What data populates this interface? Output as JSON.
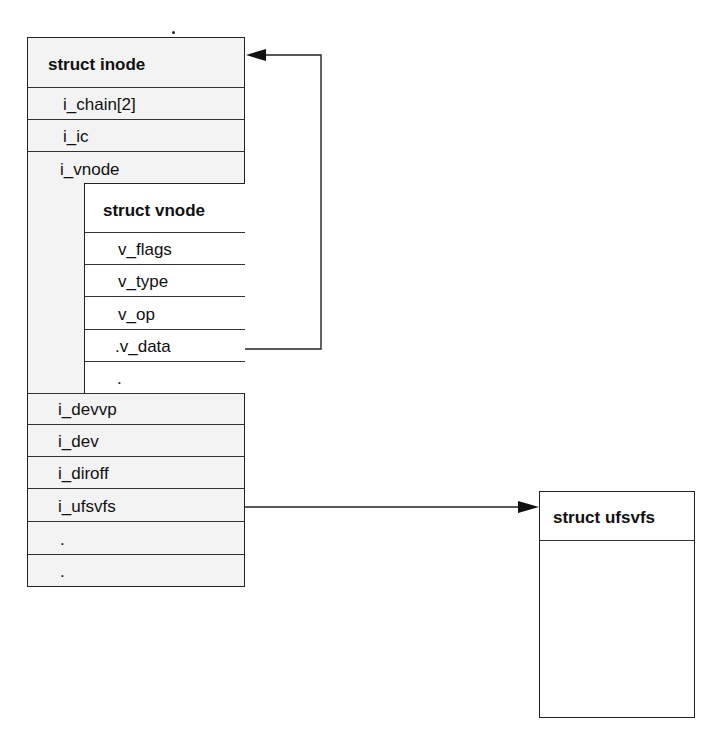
{
  "diagram": {
    "inode": {
      "title": "struct inode",
      "fields_top": [
        "i_chain[2]",
        "i_ic",
        "i_vnode"
      ],
      "fields_bottom": [
        "i_devvp",
        "i_dev",
        "i_diroff",
        "i_ufsvfs",
        ".",
        "."
      ]
    },
    "vnode": {
      "title": "struct vnode",
      "fields": [
        "v_flags",
        "v_type",
        "v_op",
        ".v_data",
        "."
      ]
    },
    "ufsvfs": {
      "title": "struct ufsvfs"
    },
    "arrows": [
      {
        "from": "vnode.v_data",
        "to": "inode",
        "label": ""
      },
      {
        "from": "inode.i_ufsvfs",
        "to": "ufsvfs",
        "label": ""
      }
    ],
    "colors": {
      "inode_fill": "#f3f3f3",
      "line": "#222222"
    }
  }
}
